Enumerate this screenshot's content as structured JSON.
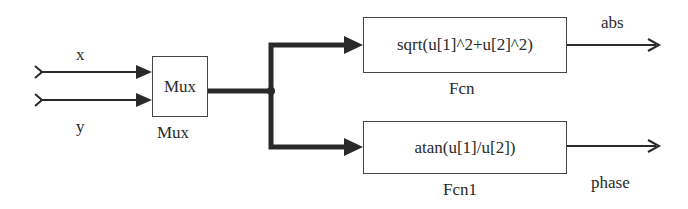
{
  "diagram": {
    "inputs": [
      {
        "label": "x"
      },
      {
        "label": "y"
      }
    ],
    "mux": {
      "text": "Mux",
      "name": "Mux"
    },
    "blocks": [
      {
        "expression": "sqrt(u[1]^2+u[2]^2)",
        "name": "Fcn",
        "output": "abs"
      },
      {
        "expression": "atan(u[1]/u[2])",
        "name": "Fcn1",
        "output": "phase"
      }
    ],
    "colors": {
      "line": "#2a2a2a",
      "box_border": "#444444",
      "background": "#ffffff"
    }
  }
}
